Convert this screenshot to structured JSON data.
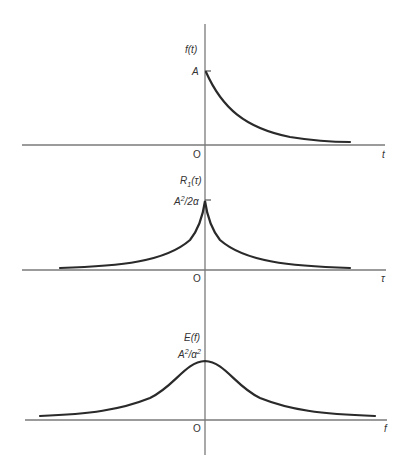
{
  "panels": [
    {
      "id": "time-signal",
      "y_label": "f(t)",
      "peak_label": "A",
      "origin_label": "O",
      "x_label": "t",
      "description": "One-sided decaying exponential f(t) = A e^{-αt}, t ≥ 0"
    },
    {
      "id": "autocorrelation",
      "y_label_main": "R",
      "y_label_sub": "1",
      "y_label_arg": "(τ)",
      "peak_label_base": "A",
      "peak_label_exp": "2",
      "peak_label_rest": "/2α",
      "origin_label": "O",
      "x_label": "τ",
      "description": "Two-sided exponential R1(τ) = (A²/2α) e^{-α|τ|}"
    },
    {
      "id": "energy-spectrum",
      "y_label": "E(f)",
      "peak_label_base": "A",
      "peak_label_exp1": "2",
      "peak_label_mid": "/α",
      "peak_label_exp2": "2",
      "origin_label": "O",
      "x_label": "f",
      "description": "Lorentzian energy spectrum E(f) with peak A²/α² at f = 0"
    }
  ],
  "colors": {
    "axis": "#7a7a7a",
    "curve": "#2a2a2a",
    "text": "#333333"
  }
}
